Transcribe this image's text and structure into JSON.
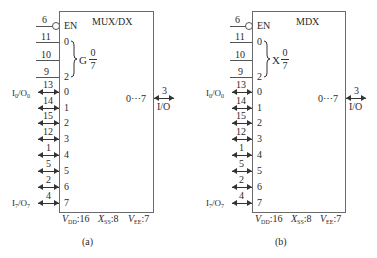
{
  "diagrams": [
    {
      "id": "a",
      "title": "MUX/DX",
      "enable": {
        "pin": "6",
        "label": "EN",
        "active_low": true
      },
      "select": {
        "pins": [
          "11",
          "10",
          "9"
        ],
        "bit_labels": {
          "first": "0",
          "last": "2"
        },
        "group_letter": "G",
        "range_top": "0",
        "range_bottom": "7"
      },
      "io_channels": [
        {
          "pin": "13",
          "index": "0",
          "external": "I0/O0"
        },
        {
          "pin": "14",
          "index": "1",
          "external": ""
        },
        {
          "pin": "15",
          "index": "2",
          "external": ""
        },
        {
          "pin": "12",
          "index": "3",
          "external": ""
        },
        {
          "pin": "1",
          "index": "4",
          "external": ""
        },
        {
          "pin": "5",
          "index": "5",
          "external": ""
        },
        {
          "pin": "2",
          "index": "6",
          "external": ""
        },
        {
          "pin": "4",
          "index": "7",
          "external": "I7/O7"
        }
      ],
      "common": {
        "internal_label": "0⋯7",
        "pin": "3",
        "label": "I/O"
      },
      "power": {
        "vdd": "VDD:16",
        "vss": "XSS:8",
        "vee": "VEE:7"
      },
      "caption": "(a)"
    },
    {
      "id": "b",
      "title": "MDX",
      "enable": {
        "pin": "6",
        "label": "EN",
        "active_low": true
      },
      "select": {
        "pins": [
          "11",
          "10",
          "9"
        ],
        "bit_labels": {
          "first": "0",
          "last": "2"
        },
        "group_letter": "X",
        "range_top": "0",
        "range_bottom": "7"
      },
      "io_channels": [
        {
          "pin": "13",
          "index": "0",
          "external": "I0/O0"
        },
        {
          "pin": "14",
          "index": "1",
          "external": ""
        },
        {
          "pin": "15",
          "index": "2",
          "external": ""
        },
        {
          "pin": "12",
          "index": "3",
          "external": ""
        },
        {
          "pin": "1",
          "index": "4",
          "external": ""
        },
        {
          "pin": "5",
          "index": "5",
          "external": ""
        },
        {
          "pin": "2",
          "index": "6",
          "external": ""
        },
        {
          "pin": "4",
          "index": "7",
          "external": "I7/O7"
        }
      ],
      "common": {
        "internal_label": "0⋯7",
        "pin": "3",
        "label": "I/O"
      },
      "power": {
        "vdd": "VDD:16",
        "vss": "XSS:8",
        "vee": "VEE:7"
      },
      "caption": "(b)"
    }
  ]
}
